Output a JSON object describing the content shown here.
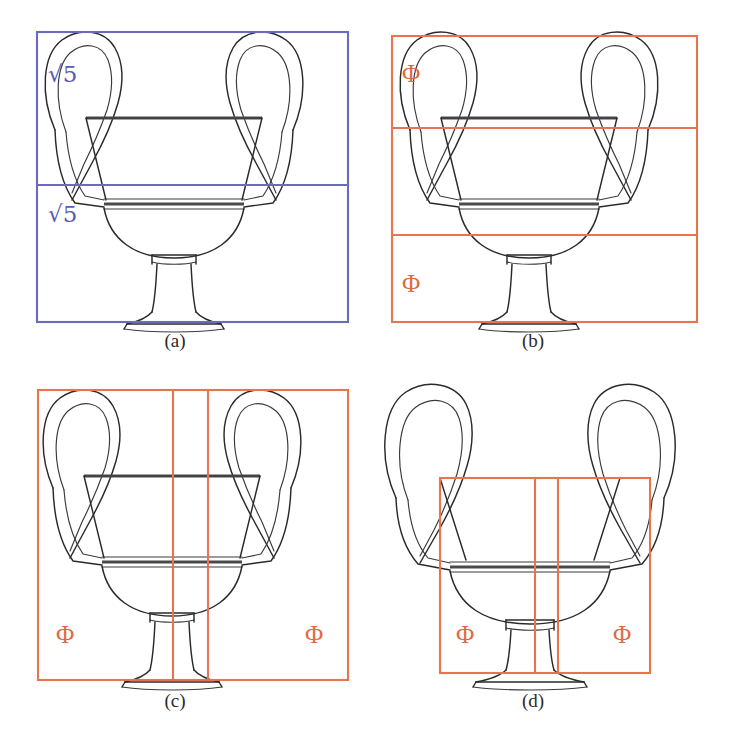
{
  "figure": {
    "background_color": "#ffffff",
    "blue_color": "#6b6bbe",
    "orange_color": "#e87350",
    "ink_color": "#2a2a2a"
  },
  "panels": [
    {
      "id": "a",
      "caption": "(a)",
      "overlay_color": "#6b6bbe",
      "overlay_kind": "rectangle-with-horizontal-divider",
      "labels": [
        {
          "text": "√5",
          "position": "upper-left"
        },
        {
          "text": "√5",
          "position": "mid-left"
        }
      ],
      "label_symbol": "sqrt5",
      "rect": {
        "x": 37,
        "y": 32,
        "w": 311,
        "h": 290
      },
      "dividers_y": [
        185
      ]
    },
    {
      "id": "b",
      "caption": "(b)",
      "overlay_color": "#e87350",
      "overlay_kind": "rectangle-with-two-horizontal-dividers",
      "labels": [
        {
          "text": "Φ",
          "position": "upper-left"
        },
        {
          "text": "Φ",
          "position": "lower-left"
        }
      ],
      "label_symbol": "phi",
      "rect": {
        "x": 34,
        "y": 36,
        "w": 305,
        "h": 286
      },
      "dividers_y": [
        128,
        235
      ]
    },
    {
      "id": "c",
      "caption": "(c)",
      "overlay_color": "#e87350",
      "overlay_kind": "rectangle-with-two-vertical-dividers",
      "labels": [
        {
          "text": "Φ",
          "position": "lower-left"
        },
        {
          "text": "Φ",
          "position": "lower-right"
        }
      ],
      "label_symbol": "phi",
      "rect": {
        "x": 38,
        "y": 32,
        "w": 310,
        "h": 290
      },
      "dividers_x": [
        173,
        208
      ]
    },
    {
      "id": "d",
      "caption": "(d)",
      "overlay_color": "#e87350",
      "overlay_kind": "inset-rectangle-with-two-vertical-dividers",
      "labels": [
        {
          "text": "Φ",
          "position": "lower-left"
        },
        {
          "text": "Φ",
          "position": "lower-right"
        }
      ],
      "label_symbol": "phi",
      "rect": {
        "x": 82,
        "y": 120,
        "w": 210,
        "h": 195
      },
      "dividers_x": [
        177,
        200
      ]
    }
  ],
  "symbols": {
    "sqrt5": "√5",
    "phi": "Φ"
  }
}
